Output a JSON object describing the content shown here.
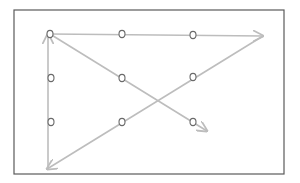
{
  "diagram": {
    "frame": {
      "x": 14,
      "y": 10,
      "width": 270,
      "height": 164,
      "stroke": "#5a5a5a"
    },
    "colors": {
      "line": "#bdbdbd",
      "dot_stroke": "#6a6a6a",
      "dot_fill": "#ffffff"
    },
    "dots": [
      {
        "x": 50,
        "y": 34
      },
      {
        "x": 122,
        "y": 34
      },
      {
        "x": 193,
        "y": 35
      },
      {
        "x": 51,
        "y": 78
      },
      {
        "x": 122,
        "y": 78
      },
      {
        "x": 193,
        "y": 77
      },
      {
        "x": 51,
        "y": 122
      },
      {
        "x": 122,
        "y": 122
      },
      {
        "x": 193,
        "y": 122
      }
    ],
    "path_segments": [
      {
        "from": [
          50,
          34
        ],
        "to": [
          263,
          36
        ],
        "arrow": true
      },
      {
        "from": [
          263,
          36
        ],
        "to": [
          47,
          169
        ],
        "arrow": true
      },
      {
        "from": [
          48,
          169
        ],
        "to": [
          48,
          34
        ],
        "arrow": true
      },
      {
        "from": [
          50,
          34
        ],
        "to": [
          207,
          131
        ],
        "arrow": true
      }
    ]
  }
}
